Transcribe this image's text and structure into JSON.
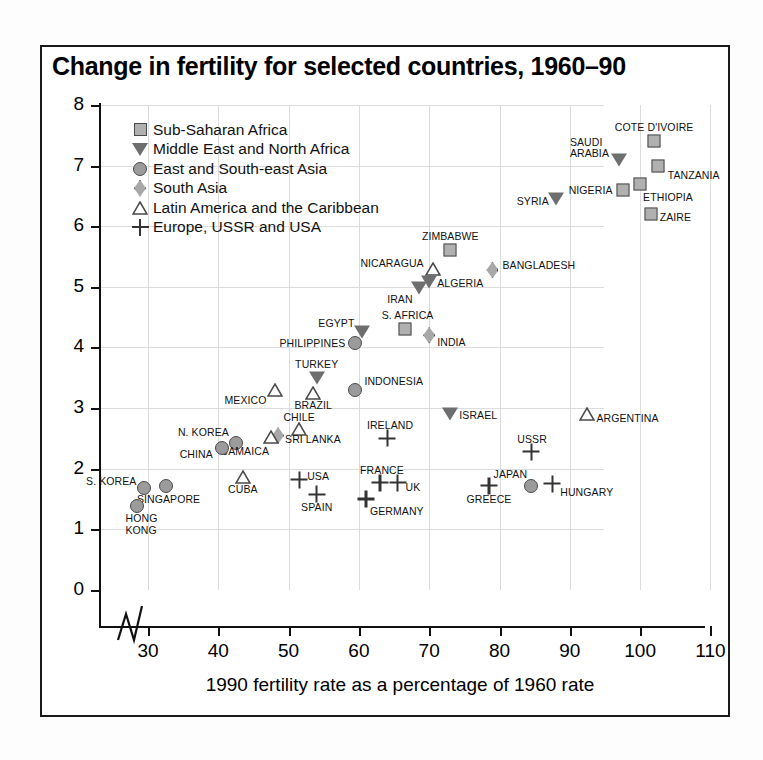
{
  "chart_data": {
    "type": "scatter",
    "title": "Change in fertility for selected countries, 1960–90",
    "xlabel": "1990 fertility rate as a percentage of 1960 rate",
    "ylabel": "Fertility rate, 1990 (children per woman)",
    "xlim": [
      25,
      110
    ],
    "ylim": [
      0,
      8
    ],
    "xticks": [
      30,
      40,
      50,
      60,
      70,
      80,
      90,
      100,
      110
    ],
    "yticks": [
      0,
      1,
      2,
      3,
      4,
      5,
      6,
      7,
      8
    ],
    "grid": true,
    "axis_break_x": true,
    "legend_position": "top-left",
    "legend": [
      {
        "key": "sub-saharan-africa",
        "label": "Sub-Saharan Africa",
        "marker": "square"
      },
      {
        "key": "middle-east-north-africa",
        "label": "Middle East and North Africa",
        "marker": "triangle-down"
      },
      {
        "key": "east-southeast-asia",
        "label": "East and South-east Asia",
        "marker": "circle"
      },
      {
        "key": "south-asia",
        "label": "South Asia",
        "marker": "diamond"
      },
      {
        "key": "latin-america-caribbean",
        "label": "Latin America and the Caribbean",
        "marker": "triangle-up"
      },
      {
        "key": "europe-ussr-usa",
        "label": "Europe, USSR and USA",
        "marker": "plus"
      }
    ],
    "points": [
      {
        "name": "COTE D'IVOIRE",
        "x": 102.0,
        "y": 7.4,
        "series": "sub-saharan-africa",
        "lpos": "c",
        "ldx": 0,
        "ldy": -14
      },
      {
        "name": "SAUDI ARABIA",
        "x": 97.0,
        "y": 7.1,
        "series": "middle-east-north-africa",
        "lpos": "r",
        "ldx": -10,
        "ldy": -12
      },
      {
        "name": "TANZANIA",
        "x": 102.5,
        "y": 7.0,
        "series": "sub-saharan-africa",
        "lpos": "l",
        "ldx": 10,
        "ldy": 9
      },
      {
        "name": "ETHIOPIA",
        "x": 100.0,
        "y": 6.7,
        "series": "sub-saharan-africa",
        "lpos": "l",
        "ldx": 3,
        "ldy": 13
      },
      {
        "name": "NIGERIA",
        "x": 97.5,
        "y": 6.6,
        "series": "sub-saharan-africa",
        "lpos": "r",
        "ldx": -10,
        "ldy": 0
      },
      {
        "name": "SYRIA",
        "x": 88.0,
        "y": 6.45,
        "series": "middle-east-north-africa",
        "lpos": "r",
        "ldx": -7,
        "ldy": 2
      },
      {
        "name": "ZAIRE",
        "x": 101.5,
        "y": 6.2,
        "series": "sub-saharan-africa",
        "lpos": "l",
        "ldx": 9,
        "ldy": 3
      },
      {
        "name": "ZIMBABWE",
        "x": 73.0,
        "y": 5.6,
        "series": "sub-saharan-africa",
        "lpos": "c",
        "ldx": 0,
        "ldy": -14
      },
      {
        "name": "BANGLADESH",
        "x": 79.0,
        "y": 5.28,
        "series": "south-asia",
        "lpos": "l",
        "ldx": 10,
        "ldy": -5
      },
      {
        "name": "NICARAGUA",
        "x": 70.5,
        "y": 5.3,
        "series": "latin-america-caribbean",
        "lpos": "r",
        "ldx": -9,
        "ldy": -6
      },
      {
        "name": "ALGERIA",
        "x": 70.0,
        "y": 5.08,
        "series": "middle-east-north-africa",
        "lpos": "l",
        "ldx": 8,
        "ldy": 1
      },
      {
        "name": "IRAN",
        "x": 68.5,
        "y": 4.98,
        "series": "middle-east-north-africa",
        "lpos": "r",
        "ldx": -6,
        "ldy": 11
      },
      {
        "name": "S. AFRICA",
        "x": 66.5,
        "y": 4.3,
        "series": "sub-saharan-africa",
        "lpos": "c",
        "ldx": 3,
        "ldy": -14
      },
      {
        "name": "EGYPT",
        "x": 60.5,
        "y": 4.25,
        "series": "middle-east-north-africa",
        "lpos": "r",
        "ldx": -8,
        "ldy": -9
      },
      {
        "name": "INDIA",
        "x": 70.0,
        "y": 4.2,
        "series": "south-asia",
        "lpos": "l",
        "ldx": 8,
        "ldy": 7
      },
      {
        "name": "PHILIPPINES",
        "x": 59.5,
        "y": 4.08,
        "series": "east-southeast-asia",
        "lpos": "r",
        "ldx": -10,
        "ldy": 0
      },
      {
        "name": "TURKEY",
        "x": 54.0,
        "y": 3.5,
        "series": "middle-east-north-africa",
        "lpos": "c",
        "ldx": 0,
        "ldy": -14
      },
      {
        "name": "MEXICO",
        "x": 48.0,
        "y": 3.3,
        "series": "latin-america-caribbean",
        "lpos": "r",
        "ldx": -8,
        "ldy": 10
      },
      {
        "name": "INDONESIA",
        "x": 59.5,
        "y": 3.3,
        "series": "east-southeast-asia",
        "lpos": "l",
        "ldx": 9,
        "ldy": -9
      },
      {
        "name": "BRAZIL",
        "x": 53.5,
        "y": 3.25,
        "series": "latin-america-caribbean",
        "lpos": "c",
        "ldx": 0,
        "ldy": 12
      },
      {
        "name": "ISRAEL",
        "x": 73.0,
        "y": 2.9,
        "series": "middle-east-north-africa",
        "lpos": "l",
        "ldx": 9,
        "ldy": 1
      },
      {
        "name": "ARGENTINA",
        "x": 92.5,
        "y": 2.9,
        "series": "latin-america-caribbean",
        "lpos": "l",
        "ldx": 9,
        "ldy": 4
      },
      {
        "name": "CHILE",
        "x": 51.5,
        "y": 2.65,
        "series": "latin-america-caribbean",
        "lpos": "c",
        "ldx": 0,
        "ldy": -12
      },
      {
        "name": "N. KOREA",
        "x": 42.5,
        "y": 2.42,
        "series": "east-southeast-asia",
        "lpos": "r",
        "ldx": -7,
        "ldy": -11
      },
      {
        "name": "SRI LANKA",
        "x": 48.5,
        "y": 2.55,
        "series": "south-asia",
        "lpos": "l",
        "ldx": 7,
        "ldy": 4
      },
      {
        "name": "JAMAICA",
        "x": 47.5,
        "y": 2.52,
        "series": "latin-america-caribbean",
        "lpos": "r",
        "ldx": -2,
        "ldy": 14
      },
      {
        "name": "CHINA",
        "x": 40.5,
        "y": 2.35,
        "series": "east-southeast-asia",
        "lpos": "r",
        "ldx": -9,
        "ldy": 6
      },
      {
        "name": "IRELAND",
        "x": 64.0,
        "y": 2.5,
        "series": "europe-ussr-usa",
        "lpos": "c",
        "ldx": 3,
        "ldy": -13
      },
      {
        "name": "USSR",
        "x": 84.5,
        "y": 2.28,
        "series": "europe-ussr-usa",
        "lpos": "c",
        "ldx": 1,
        "ldy": -13
      },
      {
        "name": "CUBA",
        "x": 43.5,
        "y": 1.87,
        "series": "latin-america-caribbean",
        "lpos": "c",
        "ldx": 0,
        "ldy": 12
      },
      {
        "name": "USA",
        "x": 51.5,
        "y": 1.82,
        "series": "europe-ussr-usa",
        "lpos": "l",
        "ldx": 8,
        "ldy": -4
      },
      {
        "name": "FRANCE",
        "x": 63.0,
        "y": 1.77,
        "series": "europe-ussr-usa",
        "lpos": "c",
        "ldx": 2,
        "ldy": -13
      },
      {
        "name": "UK",
        "x": 65.5,
        "y": 1.77,
        "series": "europe-ussr-usa",
        "lpos": "l",
        "ldx": 8,
        "ldy": 4
      },
      {
        "name": "SINGAPORE",
        "x": 32.5,
        "y": 1.72,
        "series": "east-southeast-asia",
        "lpos": "c",
        "ldx": 3,
        "ldy": 13
      },
      {
        "name": "S. KOREA",
        "x": 29.5,
        "y": 1.68,
        "series": "east-southeast-asia",
        "lpos": "r",
        "ldx": -8,
        "ldy": -7
      },
      {
        "name": "JAPAN",
        "x": 84.5,
        "y": 1.72,
        "series": "east-southeast-asia",
        "lpos": "r",
        "ldx": -4,
        "ldy": -12
      },
      {
        "name": "HUNGARY",
        "x": 87.5,
        "y": 1.75,
        "series": "europe-ussr-usa",
        "lpos": "l",
        "ldx": 8,
        "ldy": 8
      },
      {
        "name": "SPAIN",
        "x": 54.0,
        "y": 1.58,
        "series": "europe-ussr-usa",
        "lpos": "c",
        "ldx": 0,
        "ldy": 13
      },
      {
        "name": "GREECE",
        "x": 78.5,
        "y": 1.72,
        "series": "europe-ussr-usa",
        "lpos": "c",
        "ldx": 0,
        "ldy": 13
      },
      {
        "name": "GERMANY",
        "x": 61.0,
        "y": 1.5,
        "series": "europe-ussr-usa",
        "lpos": "l",
        "ldx": 4,
        "ldy": 12
      },
      {
        "name": "HONG KONG",
        "x": 28.5,
        "y": 1.38,
        "series": "east-southeast-asia",
        "lpos": "c",
        "ldx": 4,
        "ldy": 18
      }
    ]
  }
}
